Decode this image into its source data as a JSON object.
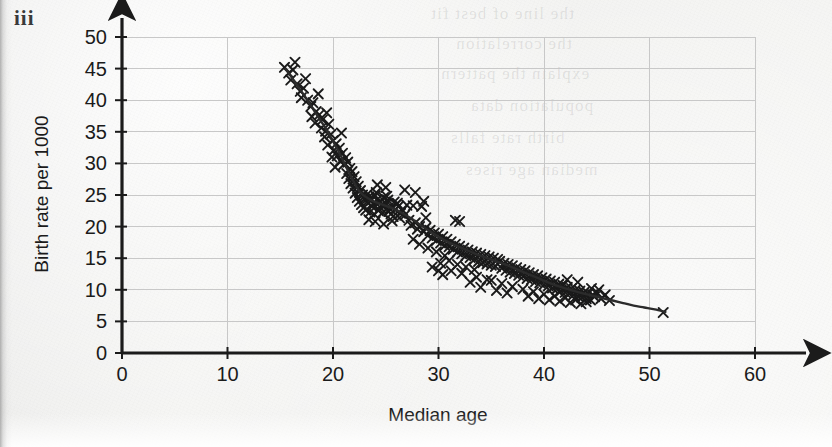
{
  "part_label": "iii",
  "chart_data": {
    "type": "scatter",
    "title": "",
    "xlabel": "Median age",
    "ylabel": "Birth rate per 1000",
    "xlim": [
      0,
      60
    ],
    "ylim": [
      0,
      50
    ],
    "xticks": [
      0,
      10,
      20,
      30,
      40,
      50,
      60
    ],
    "yticks": [
      0,
      5,
      10,
      15,
      20,
      25,
      30,
      35,
      40,
      45,
      50
    ],
    "grid": true,
    "grid_color": "#c8c8c8",
    "legend": "none",
    "marker": "x",
    "marker_color": "#1a1a1a",
    "axis_color": "#1b1b1b",
    "trend_line": {
      "label": "fitted curve",
      "color": "#2b2b2b",
      "points": [
        [
          15.5,
          45.0
        ],
        [
          16.5,
          42.6
        ],
        [
          17.5,
          40.2
        ],
        [
          18.5,
          37.6
        ],
        [
          19.5,
          35.0
        ],
        [
          20.5,
          32.0
        ],
        [
          21.5,
          28.6
        ],
        [
          22.5,
          25.6
        ],
        [
          23.5,
          24.3
        ],
        [
          24.5,
          23.6
        ],
        [
          25.5,
          23.0
        ],
        [
          26.5,
          22.2
        ],
        [
          27.5,
          21.2
        ],
        [
          28.5,
          20.0
        ],
        [
          29.5,
          18.9
        ],
        [
          30.5,
          17.9
        ],
        [
          31.5,
          17.1
        ],
        [
          32.5,
          16.4
        ],
        [
          33.5,
          15.7
        ],
        [
          34.5,
          15.1
        ],
        [
          35.5,
          14.5
        ],
        [
          36.5,
          13.9
        ],
        [
          37.5,
          13.2
        ],
        [
          38.5,
          12.5
        ],
        [
          39.5,
          11.8
        ],
        [
          40.5,
          11.1
        ],
        [
          41.5,
          10.5
        ],
        [
          42.5,
          10.0
        ],
        [
          43.5,
          9.5
        ],
        [
          44.5,
          9.1
        ],
        [
          45.5,
          8.7
        ],
        [
          46.5,
          8.3
        ],
        [
          47.5,
          7.9
        ],
        [
          48.5,
          7.5
        ],
        [
          49.5,
          7.2
        ],
        [
          50.5,
          6.9
        ],
        [
          51.5,
          6.5
        ]
      ]
    },
    "points": [
      [
        15.4,
        45.2
      ],
      [
        15.8,
        44.3
      ],
      [
        16.2,
        44.8
      ],
      [
        16.0,
        43.2
      ],
      [
        16.6,
        42.6
      ],
      [
        16.9,
        41.4
      ],
      [
        17.2,
        41.9
      ],
      [
        17.0,
        40.4
      ],
      [
        17.6,
        40.0
      ],
      [
        17.9,
        39.0
      ],
      [
        18.1,
        39.6
      ],
      [
        18.4,
        38.2
      ],
      [
        18.0,
        37.4
      ],
      [
        18.7,
        37.7
      ],
      [
        18.3,
        36.4
      ],
      [
        19.0,
        36.9
      ],
      [
        18.9,
        35.6
      ],
      [
        19.3,
        35.1
      ],
      [
        19.6,
        36.2
      ],
      [
        19.2,
        34.2
      ],
      [
        19.8,
        34.6
      ],
      [
        20.0,
        33.6
      ],
      [
        19.5,
        32.9
      ],
      [
        20.3,
        33.1
      ],
      [
        20.1,
        32.1
      ],
      [
        20.6,
        32.4
      ],
      [
        20.4,
        31.2
      ],
      [
        20.9,
        31.6
      ],
      [
        20.7,
        30.4
      ],
      [
        21.2,
        30.9
      ],
      [
        21.0,
        29.8
      ],
      [
        21.4,
        30.2
      ],
      [
        19.9,
        31.0
      ],
      [
        20.2,
        29.4
      ],
      [
        21.6,
        29.2
      ],
      [
        21.3,
        28.4
      ],
      [
        21.8,
        28.7
      ],
      [
        21.5,
        27.6
      ],
      [
        22.0,
        27.9
      ],
      [
        21.7,
        26.8
      ],
      [
        22.2,
        27.1
      ],
      [
        21.9,
        26.1
      ],
      [
        22.4,
        26.4
      ],
      [
        22.1,
        25.3
      ],
      [
        22.6,
        25.7
      ],
      [
        22.3,
        24.6
      ],
      [
        22.8,
        25.0
      ],
      [
        22.5,
        24.0
      ],
      [
        23.0,
        24.4
      ],
      [
        22.7,
        23.5
      ],
      [
        23.2,
        23.9
      ],
      [
        22.9,
        23.0
      ],
      [
        23.4,
        24.7
      ],
      [
        23.1,
        22.6
      ],
      [
        23.6,
        24.1
      ],
      [
        23.3,
        25.2
      ],
      [
        23.8,
        23.6
      ],
      [
        23.5,
        22.3
      ],
      [
        24.0,
        24.9
      ],
      [
        23.7,
        23.2
      ],
      [
        24.2,
        24.3
      ],
      [
        23.9,
        22.0
      ],
      [
        24.4,
        23.8
      ],
      [
        24.1,
        25.4
      ],
      [
        24.6,
        23.4
      ],
      [
        24.3,
        22.5
      ],
      [
        24.8,
        24.6
      ],
      [
        24.5,
        23.0
      ],
      [
        25.0,
        23.7
      ],
      [
        24.7,
        22.2
      ],
      [
        25.2,
        24.2
      ],
      [
        24.9,
        23.3
      ],
      [
        25.4,
        22.8
      ],
      [
        25.1,
        24.8
      ],
      [
        25.6,
        23.1
      ],
      [
        25.3,
        22.4
      ],
      [
        25.8,
        23.9
      ],
      [
        25.5,
        22.0
      ],
      [
        26.0,
        23.5
      ],
      [
        25.7,
        21.6
      ],
      [
        26.2,
        23.2
      ],
      [
        25.9,
        22.7
      ],
      [
        26.4,
        22.1
      ],
      [
        26.1,
        23.7
      ],
      [
        26.6,
        22.6
      ],
      [
        26.3,
        21.4
      ],
      [
        23.4,
        21.1
      ],
      [
        24.0,
        20.8
      ],
      [
        24.8,
        20.4
      ],
      [
        25.6,
        20.9
      ],
      [
        26.8,
        21.8
      ],
      [
        27.0,
        23.4
      ],
      [
        27.6,
        23.3
      ],
      [
        28.4,
        23.2
      ],
      [
        27.2,
        21.0
      ],
      [
        27.4,
        20.2
      ],
      [
        27.8,
        20.6
      ],
      [
        28.0,
        19.6
      ],
      [
        28.2,
        20.0
      ],
      [
        28.6,
        19.2
      ],
      [
        28.8,
        19.8
      ],
      [
        29.0,
        18.6
      ],
      [
        29.2,
        19.4
      ],
      [
        29.4,
        18.2
      ],
      [
        29.6,
        19.0
      ],
      [
        29.8,
        17.8
      ],
      [
        30.0,
        18.8
      ],
      [
        30.2,
        17.4
      ],
      [
        30.4,
        18.4
      ],
      [
        30.6,
        17.0
      ],
      [
        30.8,
        18.0
      ],
      [
        31.0,
        16.8
      ],
      [
        31.2,
        17.6
      ],
      [
        31.4,
        16.4
      ],
      [
        31.6,
        17.2
      ],
      [
        31.8,
        16.0
      ],
      [
        32.0,
        16.9
      ],
      [
        32.2,
        15.7
      ],
      [
        32.4,
        16.6
      ],
      [
        32.6,
        15.4
      ],
      [
        32.8,
        16.3
      ],
      [
        33.0,
        15.1
      ],
      [
        33.2,
        16.0
      ],
      [
        33.4,
        14.8
      ],
      [
        33.6,
        15.8
      ],
      [
        33.8,
        14.5
      ],
      [
        34.0,
        15.6
      ],
      [
        34.2,
        14.3
      ],
      [
        34.4,
        15.4
      ],
      [
        34.6,
        14.1
      ],
      [
        34.8,
        15.2
      ],
      [
        35.0,
        13.9
      ],
      [
        35.2,
        15.0
      ],
      [
        35.4,
        13.7
      ],
      [
        35.6,
        14.8
      ],
      [
        28.2,
        17.2
      ],
      [
        29.0,
        16.6
      ],
      [
        29.8,
        16.0
      ],
      [
        30.6,
        15.4
      ],
      [
        27.6,
        18.0
      ],
      [
        30.2,
        14.2
      ],
      [
        31.0,
        14.6
      ],
      [
        31.8,
        14.0
      ],
      [
        32.6,
        13.6
      ],
      [
        33.4,
        13.2
      ],
      [
        28.8,
        21.4
      ],
      [
        31.6,
        21.0
      ],
      [
        32.0,
        20.8
      ],
      [
        30.0,
        13.0
      ],
      [
        29.4,
        13.6
      ],
      [
        35.8,
        14.5
      ],
      [
        36.0,
        13.4
      ],
      [
        36.2,
        14.2
      ],
      [
        36.4,
        13.1
      ],
      [
        36.6,
        14.0
      ],
      [
        36.8,
        12.8
      ],
      [
        37.0,
        13.8
      ],
      [
        37.2,
        12.6
      ],
      [
        37.4,
        13.5
      ],
      [
        37.6,
        12.3
      ],
      [
        37.8,
        13.2
      ],
      [
        38.0,
        12.1
      ],
      [
        38.2,
        13.0
      ],
      [
        38.4,
        11.8
      ],
      [
        38.6,
        12.7
      ],
      [
        38.8,
        11.6
      ],
      [
        39.0,
        12.4
      ],
      [
        39.2,
        11.3
      ],
      [
        39.4,
        12.2
      ],
      [
        39.6,
        11.1
      ],
      [
        39.8,
        11.9
      ],
      [
        40.0,
        10.8
      ],
      [
        40.2,
        11.7
      ],
      [
        40.4,
        10.6
      ],
      [
        40.6,
        11.4
      ],
      [
        40.8,
        10.3
      ],
      [
        41.0,
        11.2
      ],
      [
        41.2,
        10.1
      ],
      [
        41.4,
        10.9
      ],
      [
        41.6,
        9.8
      ],
      [
        41.8,
        10.7
      ],
      [
        42.0,
        9.6
      ],
      [
        42.2,
        10.4
      ],
      [
        42.4,
        9.4
      ],
      [
        42.6,
        10.2
      ],
      [
        42.8,
        9.2
      ],
      [
        43.0,
        10.0
      ],
      [
        43.2,
        9.0
      ],
      [
        43.4,
        9.8
      ],
      [
        43.6,
        8.8
      ],
      [
        43.8,
        9.6
      ],
      [
        44.0,
        8.6
      ],
      [
        44.2,
        9.4
      ],
      [
        44.4,
        8.4
      ],
      [
        44.6,
        9.2
      ],
      [
        35.0,
        11.5
      ],
      [
        36.0,
        11.0
      ],
      [
        37.0,
        10.5
      ],
      [
        38.0,
        10.1
      ],
      [
        39.0,
        9.7
      ],
      [
        40.0,
        9.3
      ],
      [
        41.0,
        9.0
      ],
      [
        42.0,
        8.7
      ],
      [
        43.0,
        8.4
      ],
      [
        44.0,
        8.1
      ],
      [
        39.5,
        8.6
      ],
      [
        40.5,
        8.4
      ],
      [
        41.5,
        8.2
      ],
      [
        42.5,
        8.0
      ],
      [
        43.5,
        7.8
      ],
      [
        44.8,
        8.9
      ],
      [
        45.0,
        9.6
      ],
      [
        45.4,
        8.6
      ],
      [
        45.8,
        9.2
      ],
      [
        46.2,
        8.3
      ],
      [
        34.0,
        10.4
      ],
      [
        33.0,
        11.2
      ],
      [
        35.5,
        9.9
      ],
      [
        36.5,
        9.5
      ],
      [
        38.5,
        9.0
      ],
      [
        51.3,
        6.4
      ],
      [
        44.5,
        10.2
      ],
      [
        45.2,
        10.0
      ],
      [
        43.2,
        11.2
      ],
      [
        42.2,
        11.6
      ],
      [
        26.8,
        25.8
      ],
      [
        27.8,
        25.4
      ],
      [
        28.6,
        24.0
      ],
      [
        24.2,
        26.6
      ],
      [
        25.0,
        26.2
      ],
      [
        33.6,
        12.0
      ],
      [
        34.6,
        11.6
      ],
      [
        32.2,
        12.6
      ],
      [
        31.2,
        13.0
      ],
      [
        30.4,
        12.4
      ],
      [
        20.8,
        34.8
      ],
      [
        19.4,
        38.0
      ],
      [
        18.6,
        41.0
      ],
      [
        17.4,
        43.4
      ],
      [
        16.4,
        46.0
      ]
    ]
  },
  "ghost_text": [
    "the line of best fit",
    "the correlation",
    "explain the pattern",
    "population data",
    "birth rate falls",
    "median age rises"
  ]
}
